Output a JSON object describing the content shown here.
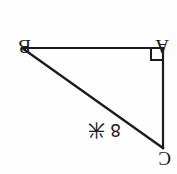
{
  "figure": {
    "orientation_note": "scan-rotated-180",
    "background_color": "#fefefe",
    "stroke_color": "#1b1b1b",
    "stroke_width": 2,
    "vertices": {
      "a": {
        "label": "A",
        "x": 163,
        "y": 48,
        "role": "right-angle"
      },
      "b": {
        "label": "B",
        "x": 22,
        "y": 48,
        "role": "acute"
      },
      "c": {
        "label": "C",
        "x": 163,
        "y": 148,
        "role": "acute"
      }
    },
    "right_angle_marker": {
      "at_vertex": "A",
      "size": 12,
      "visible": true
    },
    "edges": [
      {
        "name": "AB",
        "from": "B",
        "to": "A",
        "kind": "leg"
      },
      {
        "name": "AC",
        "from": "A",
        "to": "C",
        "kind": "leg"
      },
      {
        "name": "BC",
        "from": "B",
        "to": "C",
        "kind": "hypotenuse"
      }
    ],
    "measure_label": {
      "value": "8",
      "unit": "米",
      "applies_to": "BC"
    }
  }
}
